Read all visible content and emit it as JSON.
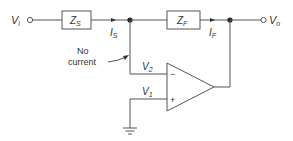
{
  "diagram": {
    "type": "inverting op-amp circuit",
    "colors": {
      "line": "#555555",
      "text": "#333333",
      "background": "#ffffff"
    },
    "terminals": {
      "input": {
        "label": "V",
        "subscript": "i"
      },
      "output": {
        "label": "V",
        "subscript": "o"
      }
    },
    "components": {
      "source_impedance": {
        "label": "Z",
        "subscript": "S"
      },
      "feedback_impedance": {
        "label": "Z",
        "subscript": "F"
      }
    },
    "currents": {
      "source_current": {
        "label": "I",
        "subscript": "S"
      },
      "feedback_current": {
        "label": "I",
        "subscript": "F"
      }
    },
    "opamp": {
      "inverting_symbol": "−",
      "noninverting_symbol": "+",
      "v2": {
        "label": "V",
        "subscript": "2"
      },
      "v1": {
        "label": "V",
        "subscript": "1"
      }
    },
    "annotation": {
      "line1": "No",
      "line2": "current"
    },
    "ground": {
      "symbol": "ground"
    }
  }
}
